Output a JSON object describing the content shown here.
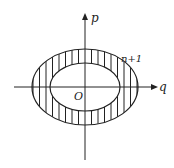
{
  "diagram": {
    "axes": {
      "x_label": "q",
      "y_label": "p",
      "origin_label": "O"
    },
    "region_label": "n+1",
    "shapes": [
      {
        "type": "ellipse",
        "role": "outer",
        "cx": 85,
        "cy": 87,
        "rx": 53,
        "ry": 38
      },
      {
        "type": "ellipse",
        "role": "inner",
        "cx": 85,
        "cy": 87,
        "rx": 35,
        "ry": 24
      }
    ],
    "hatch": "vertical lines in annulus between ellipses"
  }
}
